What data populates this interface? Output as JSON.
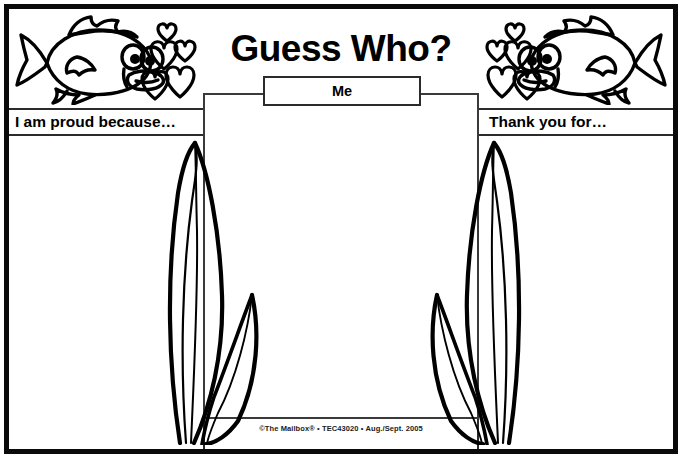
{
  "worksheet": {
    "title": "Guess Who?",
    "center_label": "Me",
    "left_prompt": "I am proud because…",
    "right_prompt": "Thank you for…",
    "copyright": "©The Mailbox® • TEC43020 • Aug./Sept. 2005",
    "decor": {
      "fish_left": "fish-facing-right-with-hearts",
      "fish_right": "fish-facing-left-with-hearts",
      "seaweed_left": "seaweed-blades",
      "seaweed_right": "seaweed-blades"
    },
    "colors": {
      "ink": "#000000",
      "frame": "#0a0a0a",
      "rule": "#3a3a3a",
      "paper": "#ffffff"
    }
  }
}
